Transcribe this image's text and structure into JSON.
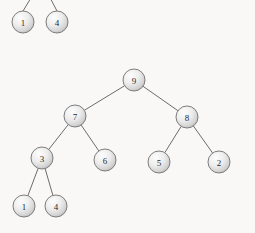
{
  "figure": {
    "kind": "binary-tree-diagram",
    "background_color": "#f9f8f7",
    "edge_color": "#6c6c6c",
    "node_stroke_color": "#7d7d7d",
    "node_fill_light": "#fdfdfd",
    "node_fill_mid": "#e3e3e3",
    "node_fill_dark": "#b8b8b8",
    "label_color": "#2b2b2b",
    "node_radius": 11
  },
  "trees": [
    {
      "id": "cropped-top-fragment",
      "name": "top-left-partial-tree",
      "note_visible": false,
      "nodes": [
        {
          "id": "t1",
          "label": "1",
          "x": 23,
          "y": 22
        },
        {
          "id": "t2",
          "label": "4",
          "x": 57,
          "y": 22
        }
      ],
      "edges": [
        {
          "from_x": 23,
          "from_y": 11,
          "to_x": 37,
          "to_y": -12
        },
        {
          "from_x": 57,
          "from_y": 11,
          "to_x": 45,
          "to_y": -12
        }
      ]
    },
    {
      "id": "main-tree",
      "name": "main-binary-tree",
      "nodes": [
        {
          "id": "n9",
          "label": "9",
          "x": 134,
          "y": 80
        },
        {
          "id": "n7",
          "label": "7",
          "x": 75,
          "y": 116
        },
        {
          "id": "n8",
          "label": "8",
          "x": 187,
          "y": 117
        },
        {
          "id": "n3",
          "label": "3",
          "x": 42,
          "y": 158
        },
        {
          "id": "n6",
          "label": "6",
          "x": 105,
          "y": 160
        },
        {
          "id": "n5",
          "label": "5",
          "x": 159,
          "y": 162
        },
        {
          "id": "n2",
          "label": "2",
          "x": 219,
          "y": 162
        },
        {
          "id": "n1",
          "label": "1",
          "x": 24,
          "y": 206
        },
        {
          "id": "n4",
          "label": "4",
          "x": 56,
          "y": 206
        }
      ],
      "edges": [
        {
          "from": "n9",
          "to": "n7"
        },
        {
          "from": "n9",
          "to": "n8"
        },
        {
          "from": "n7",
          "to": "n3"
        },
        {
          "from": "n7",
          "to": "n6"
        },
        {
          "from": "n8",
          "to": "n5"
        },
        {
          "from": "n8",
          "to": "n2"
        },
        {
          "from": "n3",
          "to": "n1"
        },
        {
          "from": "n3",
          "to": "n4"
        }
      ]
    }
  ]
}
